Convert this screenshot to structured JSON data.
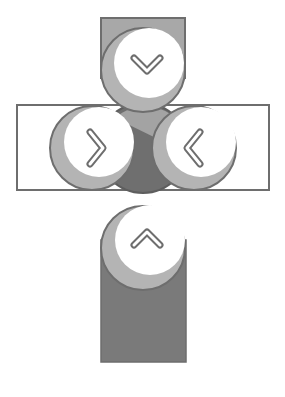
{
  "diagram": {
    "colors": {
      "outline": "#6e6e6e",
      "top_fill": "#a8a8a8",
      "side_fill": "#ffffff",
      "bottom_fill": "#7a7a7a",
      "center_fill": "#6f6f6f",
      "button_face": "#ffffff",
      "button_shadow": "#b4b4b4"
    },
    "buttons": [
      {
        "id": "down",
        "glyph": "chevron-down",
        "label": "Down"
      },
      {
        "id": "right",
        "glyph": "chevron-right",
        "label": "Right"
      },
      {
        "id": "left",
        "glyph": "chevron-left",
        "label": "Left"
      },
      {
        "id": "up",
        "glyph": "chevron-up",
        "label": "Up"
      }
    ]
  }
}
